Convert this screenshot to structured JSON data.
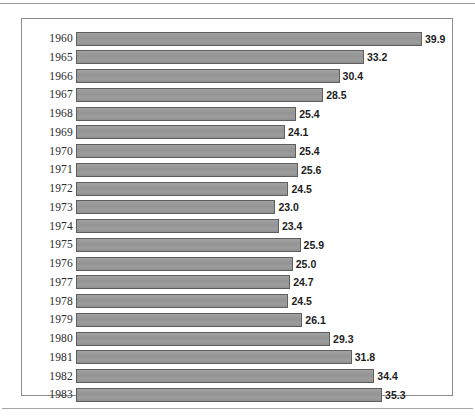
{
  "figure": {
    "frame_border_color": "#8c8c8c",
    "background_color": "#ffffff",
    "bar_fill_color": "#9a9a9a",
    "bar_border_color": "#5e5e5e",
    "value_label_color": "#1d1d1d",
    "year_label_color": "#2b2b2b"
  },
  "chart_data": {
    "type": "bar",
    "orientation": "horizontal",
    "title": "",
    "subtitle": "",
    "xlabel": "",
    "ylabel": "",
    "grid": false,
    "legend": false,
    "xlim": [
      0,
      39.9
    ],
    "categories": [
      "1960",
      "1965",
      "1966",
      "1967",
      "1968",
      "1969",
      "1970",
      "1971",
      "1972",
      "1973",
      "1974",
      "1975",
      "1976",
      "1977",
      "1978",
      "1979",
      "1980",
      "1981",
      "1982",
      "1983"
    ],
    "values": [
      39.9,
      33.2,
      30.4,
      28.5,
      25.4,
      24.1,
      25.4,
      25.6,
      24.5,
      23.0,
      23.4,
      25.9,
      25.0,
      24.7,
      24.5,
      26.1,
      29.3,
      31.8,
      34.4,
      35.3
    ],
    "data_labels": [
      "39.9",
      "33.2",
      "30.4",
      "28.5",
      "25.4",
      "24.1",
      "25.4",
      "25.6",
      "24.5",
      "23.0",
      "23.4",
      "25.9",
      "25.0",
      "24.7",
      "24.5",
      "26.1",
      "29.3",
      "31.8",
      "34.4",
      "35.3"
    ],
    "rows": [
      {
        "category": "1960",
        "value": 39.9,
        "label": "39.9"
      },
      {
        "category": "1965",
        "value": 33.2,
        "label": "33.2"
      },
      {
        "category": "1966",
        "value": 30.4,
        "label": "30.4"
      },
      {
        "category": "1967",
        "value": 28.5,
        "label": "28.5"
      },
      {
        "category": "1968",
        "value": 25.4,
        "label": "25.4"
      },
      {
        "category": "1969",
        "value": 24.1,
        "label": "24.1"
      },
      {
        "category": "1970",
        "value": 25.4,
        "label": "25.4"
      },
      {
        "category": "1971",
        "value": 25.6,
        "label": "25.6"
      },
      {
        "category": "1972",
        "value": 24.5,
        "label": "24.5"
      },
      {
        "category": "1973",
        "value": 23.0,
        "label": "23.0"
      },
      {
        "category": "1974",
        "value": 23.4,
        "label": "23.4"
      },
      {
        "category": "1975",
        "value": 25.9,
        "label": "25.9"
      },
      {
        "category": "1976",
        "value": 25.0,
        "label": "25.0"
      },
      {
        "category": "1977",
        "value": 24.7,
        "label": "24.7"
      },
      {
        "category": "1978",
        "value": 24.5,
        "label": "24.5"
      },
      {
        "category": "1979",
        "value": 26.1,
        "label": "26.1"
      },
      {
        "category": "1980",
        "value": 29.3,
        "label": "29.3"
      },
      {
        "category": "1981",
        "value": 31.8,
        "label": "31.8"
      },
      {
        "category": "1982",
        "value": 34.4,
        "label": "34.4"
      },
      {
        "category": "1983",
        "value": 35.3,
        "label": "35.3"
      }
    ]
  }
}
